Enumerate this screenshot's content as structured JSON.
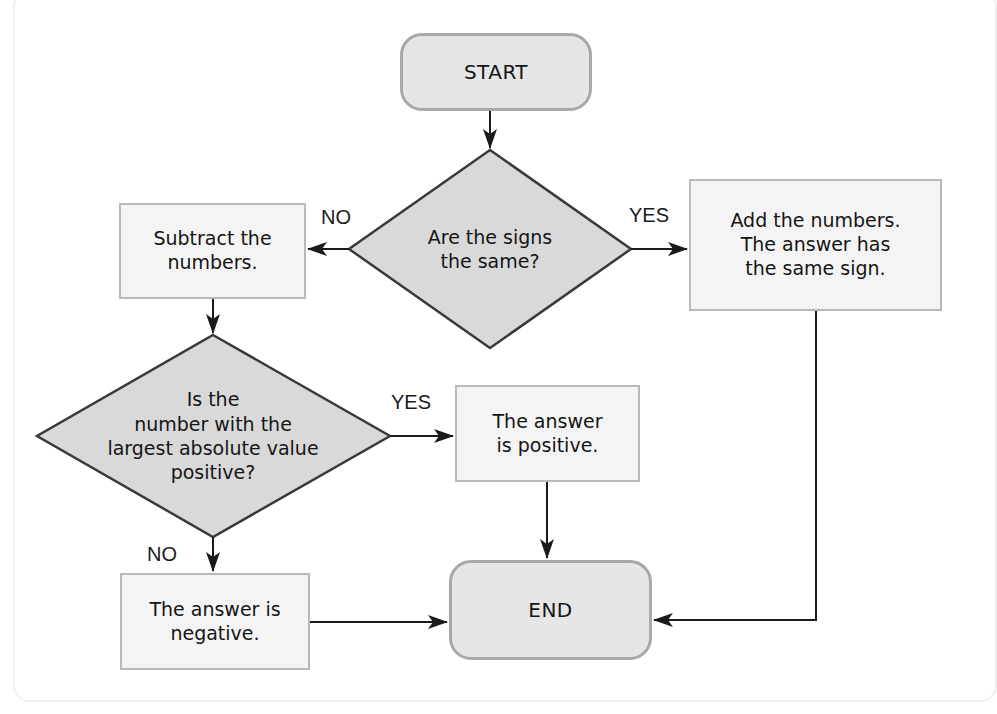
{
  "flowchart": {
    "start": {
      "label": "START"
    },
    "decision_signs": {
      "label": "Are the signs\nthe same?"
    },
    "branch_no_1": {
      "label": "NO"
    },
    "branch_yes_1": {
      "label": "YES"
    },
    "subtract": {
      "label": "Subtract the\nnumbers."
    },
    "add": {
      "label": "Add the numbers.\nThe answer has\nthe same sign."
    },
    "decision_largest": {
      "label": "Is the\nnumber with the\nlargest absolute value\npositive?"
    },
    "branch_yes_2": {
      "label": "YES"
    },
    "branch_no_2": {
      "label": "NO"
    },
    "positive": {
      "label": "The answer\nis positive."
    },
    "negative": {
      "label": "The answer is\nnegative."
    },
    "end": {
      "label": "END"
    }
  },
  "colors": {
    "terminal_fill": "#e6e6e6",
    "terminal_border": "#a8a8a8",
    "decision_fill": "#d9d9d9",
    "decision_border": "#3a3a3a",
    "process_fill": "#f4f4f4",
    "process_border": "#b9b9b9",
    "connector": "#1a1a1a"
  }
}
